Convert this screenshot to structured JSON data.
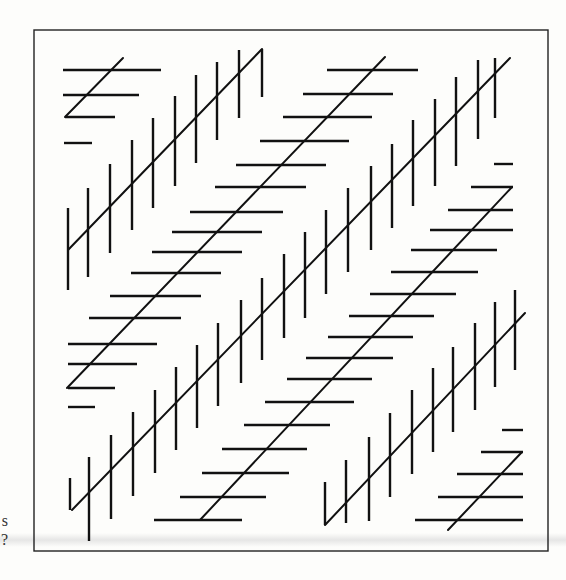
{
  "figure": {
    "stroke_color": "#111111",
    "frame_color": "#222222",
    "background": "#fdfdfb",
    "frame": {
      "x": 34,
      "y": 30,
      "width": 514,
      "height": 521
    },
    "bands": [
      {
        "name": "band-a-vertical-ticks",
        "hatch": "vertical",
        "diagonal": [
          68,
          250,
          262,
          49
        ],
        "ticks": [
          [
            68,
            208,
            68,
            290
          ],
          [
            88,
            188,
            88,
            277
          ],
          [
            110,
            164,
            110,
            253
          ],
          [
            132,
            140,
            132,
            230
          ],
          [
            153,
            118,
            153,
            208
          ],
          [
            175,
            96,
            175,
            186
          ],
          [
            196,
            75,
            196,
            163
          ],
          [
            217,
            62,
            217,
            140
          ],
          [
            239,
            50,
            239,
            118
          ],
          [
            262,
            49,
            262,
            97
          ]
        ]
      },
      {
        "name": "band-b-horizontal-ticks",
        "hatch": "horizontal",
        "diagonal": [
          65,
          117,
          123,
          58
        ],
        "ticks": [
          [
            63,
            70,
            161,
            70
          ],
          [
            63,
            95,
            139,
            95
          ],
          [
            65,
            117,
            115,
            117
          ],
          [
            64,
            143,
            92,
            143
          ]
        ]
      },
      {
        "name": "band-c-horizontal-ticks",
        "hatch": "horizontal",
        "diagonal": [
          67,
          388,
          385,
          57
        ],
        "ticks": [
          [
            327,
            70,
            418,
            70
          ],
          [
            303,
            94,
            393,
            94
          ],
          [
            283,
            117,
            372,
            117
          ],
          [
            260,
            141,
            349,
            141
          ],
          [
            236,
            165,
            326,
            165
          ],
          [
            215,
            187,
            306,
            187
          ],
          [
            190,
            212,
            283,
            212
          ],
          [
            172,
            232,
            262,
            232
          ],
          [
            152,
            252,
            242,
            252
          ],
          [
            131,
            273,
            221,
            273
          ],
          [
            110,
            296,
            201,
            296
          ],
          [
            89,
            318,
            181,
            318
          ],
          [
            68,
            344,
            157,
            344
          ],
          [
            68,
            364,
            137,
            364
          ],
          [
            68,
            388,
            115,
            388
          ],
          [
            68,
            407,
            95,
            407
          ]
        ]
      },
      {
        "name": "band-d-vertical-ticks",
        "hatch": "vertical",
        "diagonal": [
          72,
          510,
          510,
          58
        ],
        "ticks": [
          [
            70,
            478,
            70,
            510
          ],
          [
            89,
            457,
            89,
            541
          ],
          [
            111,
            435,
            111,
            519
          ],
          [
            133,
            412,
            133,
            496
          ],
          [
            155,
            390,
            155,
            473
          ],
          [
            176,
            367,
            176,
            450
          ],
          [
            197,
            345,
            197,
            428
          ],
          [
            218,
            323,
            218,
            406
          ],
          [
            241,
            300,
            241,
            383
          ],
          [
            262,
            278,
            262,
            360
          ],
          [
            284,
            254,
            284,
            338
          ],
          [
            305,
            232,
            305,
            318
          ],
          [
            326,
            210,
            326,
            294
          ],
          [
            348,
            188,
            348,
            272
          ],
          [
            371,
            166,
            371,
            250
          ],
          [
            392,
            144,
            392,
            228
          ],
          [
            413,
            120,
            413,
            206
          ],
          [
            435,
            99,
            435,
            186
          ],
          [
            456,
            77,
            456,
            166
          ],
          [
            478,
            60,
            478,
            139
          ],
          [
            495,
            58,
            495,
            118
          ]
        ]
      },
      {
        "name": "band-e-horizontal-ticks",
        "hatch": "horizontal",
        "diagonal": [
          200,
          520,
          512,
          187
        ],
        "ticks": [
          [
            494,
            164,
            513,
            164
          ],
          [
            471,
            187,
            513,
            187
          ],
          [
            448,
            210,
            513,
            210
          ],
          [
            430,
            230,
            513,
            230
          ],
          [
            411,
            250,
            497,
            250
          ],
          [
            391,
            272,
            478,
            272
          ],
          [
            370,
            294,
            456,
            294
          ],
          [
            349,
            316,
            434,
            316
          ],
          [
            328,
            337,
            413,
            337
          ],
          [
            306,
            358,
            393,
            358
          ],
          [
            287,
            379,
            372,
            379
          ],
          [
            265,
            402,
            354,
            402
          ],
          [
            244,
            425,
            330,
            425
          ],
          [
            222,
            449,
            307,
            449
          ],
          [
            202,
            473,
            289,
            473
          ],
          [
            180,
            497,
            266,
            497
          ],
          [
            154,
            520,
            242,
            520
          ]
        ]
      },
      {
        "name": "band-f-vertical-ticks",
        "hatch": "vertical",
        "diagonal": [
          325,
          525,
          525,
          313
        ],
        "ticks": [
          [
            325,
            482,
            325,
            525
          ],
          [
            346,
            460,
            346,
            523
          ],
          [
            369,
            437,
            369,
            521
          ],
          [
            390,
            413,
            390,
            497
          ],
          [
            412,
            390,
            412,
            474
          ],
          [
            433,
            368,
            433,
            452
          ],
          [
            453,
            347,
            453,
            432
          ],
          [
            475,
            323,
            475,
            410
          ],
          [
            495,
            302,
            495,
            387
          ],
          [
            515,
            290,
            515,
            370
          ]
        ]
      },
      {
        "name": "band-g-horizontal-ticks",
        "hatch": "horizontal",
        "diagonal": [
          448,
          530,
          522,
          452
        ],
        "ticks": [
          [
            502,
            430,
            523,
            430
          ],
          [
            481,
            452,
            523,
            452
          ],
          [
            457,
            474,
            523,
            474
          ],
          [
            438,
            497,
            523,
            497
          ],
          [
            415,
            520,
            523,
            520
          ]
        ]
      }
    ]
  },
  "margin_text": [
    {
      "text": "s",
      "top": 513
    },
    {
      "text": "?",
      "top": 532
    }
  ]
}
